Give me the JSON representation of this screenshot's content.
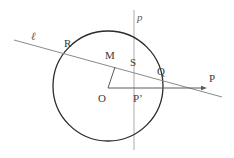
{
  "figure": {
    "type": "geometry-diagram",
    "background_color": "#ffffff",
    "width": 234,
    "height": 158
  },
  "colors": {
    "circle_stroke": "#2b2b2b",
    "secant_line": "#8a8a8a",
    "vertical_line": "#b9b9b9",
    "radius_segment": "#5a5a5a",
    "horizontal_ray": "#5a5a5a",
    "label_text": "#3a3a3a",
    "line_label_text": "#5a5a5a"
  },
  "circle": {
    "center_x": 108,
    "center_y": 86,
    "radius": 55,
    "stroke_width": 1.3
  },
  "lines": {
    "vertical": {
      "name": "p",
      "label": "p",
      "x": 134,
      "y_top": 10,
      "y_bottom": 150,
      "stroke_width": 1.2
    },
    "secant": {
      "name": "l",
      "label": "ℓ",
      "x1": 14,
      "y1": 40,
      "x2": 222,
      "y2": 97,
      "stroke_width": 1
    },
    "horizontal_ray": {
      "x1": 108,
      "y1": 88,
      "x2": 207,
      "y2": 88,
      "stroke_width": 1,
      "arrowhead": true
    },
    "radius_segment": {
      "x1": 108,
      "y1": 88,
      "x2": 115,
      "y2": 67,
      "stroke_width": 1
    }
  },
  "labels": {
    "line_l": {
      "text": "ℓ",
      "x": 31,
      "y": 31
    },
    "line_p": {
      "text": "p",
      "x": 137,
      "y": 12
    },
    "point_R": {
      "text": "R",
      "x": 64,
      "y": 38
    },
    "point_M": {
      "text": "M",
      "x": 105,
      "y": 50
    },
    "point_S": {
      "text": "S",
      "x": 130,
      "y": 57
    },
    "point_Q": {
      "text": "Q",
      "x": 157,
      "y": 66
    },
    "point_P": {
      "text": "P",
      "x": 209,
      "y": 73
    },
    "point_O": {
      "text": "O",
      "x": 98,
      "y": 93
    },
    "point_Pprime": {
      "text": "P’",
      "x": 133,
      "y": 93
    }
  },
  "points": [
    {
      "name": "R",
      "label": "R"
    },
    {
      "name": "M",
      "label": "M"
    },
    {
      "name": "S",
      "label": "S"
    },
    {
      "name": "Q",
      "label": "Q"
    },
    {
      "name": "P",
      "label": "P"
    },
    {
      "name": "O",
      "label": "O"
    },
    {
      "name": "P-prime",
      "label": "P’"
    }
  ]
}
